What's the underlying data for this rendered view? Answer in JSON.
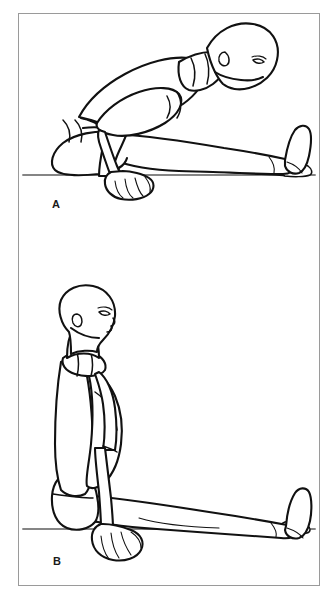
{
  "figure": {
    "frame": {
      "border_color": "#9a9a9a",
      "background_color": "#ffffff"
    },
    "ink_color": "#111111",
    "ground_color": "#5d5d5d",
    "panels": [
      {
        "id": "a",
        "label": "A",
        "caption": "A",
        "description": "Seated long-sitting figure bent fully forward over extended legs, arms reaching past the knees, hands resting on the floor",
        "ground_line_y": 174
      },
      {
        "id": "b",
        "label": "B",
        "caption": "B",
        "description": "Seated long-sitting figure upright with straight back, legs extended forward, arm down and hand resting flat on the floor beside the hip",
        "ground_line_y": 528
      }
    ]
  }
}
